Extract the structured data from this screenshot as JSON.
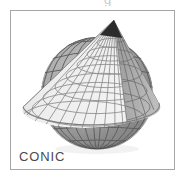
{
  "figure": {
    "label": "CONIC",
    "top_clipped_text": "g",
    "frame": {
      "border_color": "#a6a6a6",
      "background_color": "#ffffff"
    },
    "label_color": "#4a4a4a"
  },
  "illustration": {
    "name": "conic-map-projection",
    "description": "A graticule-covered cone set over a graticule-covered sphere, illustrating the conic map projection",
    "elements": [
      {
        "name": "cone-surface",
        "shading": "lit",
        "fill_color": "#e9e9e9",
        "graticule_color": "#8d8d8d"
      },
      {
        "name": "cone-surface-shadowed",
        "shading": "shaded",
        "fill_color": "#a8a8a8",
        "graticule_color": "#6f6f6f"
      },
      {
        "name": "globe-sphere",
        "shading": "shaded",
        "fill_color": "#9b9b9b",
        "graticule_color": "#5d5d5d"
      },
      {
        "name": "globe-sphere-lower",
        "shading": "dark",
        "fill_color": "#6e6e6e",
        "graticule_color": "#3d3d3d"
      },
      {
        "name": "cone-apex",
        "fill_color": "#2b2b2b"
      }
    ],
    "apex_point": {
      "x": 103,
      "y": 9
    },
    "cone_base_rim": {
      "cx": 72,
      "cy": 108,
      "rx": 62,
      "ry": 18
    },
    "globe": {
      "cx": 86,
      "cy": 82,
      "r": 56
    }
  }
}
